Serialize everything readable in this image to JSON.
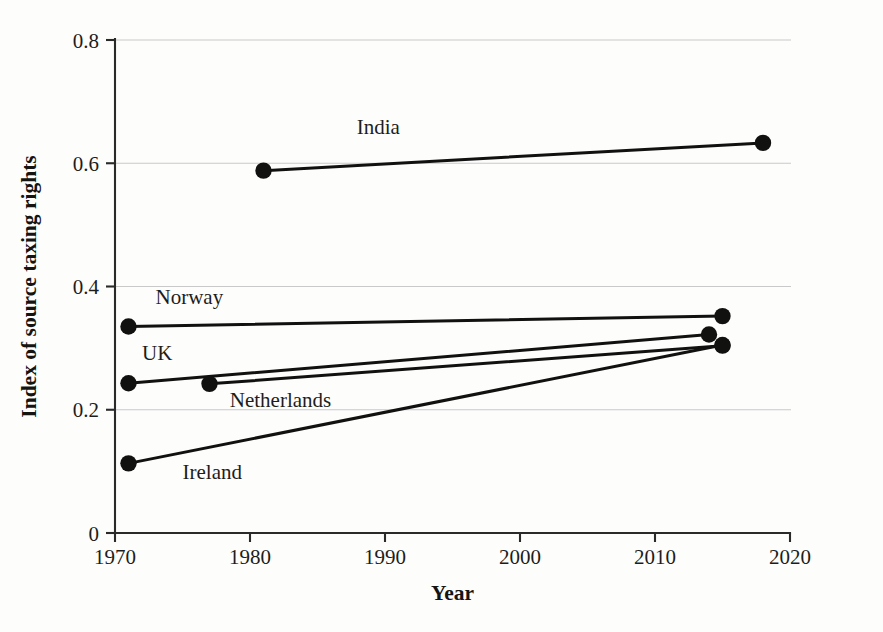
{
  "chart_data": {
    "type": "line",
    "title": "",
    "subtitle": "",
    "xlabel": "Year",
    "ylabel": "Index of source taxing rights",
    "xlim": [
      1970,
      2020
    ],
    "ylim": [
      0,
      0.8
    ],
    "xticks": [
      "1970",
      "1980",
      "1990",
      "2000",
      "2010",
      "2020"
    ],
    "xtick_values": [
      1970,
      1980,
      1990,
      2000,
      2010,
      2020
    ],
    "yticks": [
      "0",
      "0.2",
      "0.4",
      "0.6",
      "0.8"
    ],
    "ytick_values": [
      0,
      0.2,
      0.4,
      0.6,
      0.8
    ],
    "grid": "horizontal",
    "legend_position": "inline-annotations",
    "marker": "filled-circle",
    "line_color": "#111110",
    "grid_color": "#c9c9c9",
    "axis_color": "#2a2a28",
    "background": "#fdfdfc",
    "series": [
      {
        "name": "India",
        "x": [
          1981,
          2018
        ],
        "values": [
          0.588,
          0.633
        ],
        "label": "India",
        "label_x": 1989.5,
        "label_y": 0.648,
        "label_anchor": "middle"
      },
      {
        "name": "Norway",
        "x": [
          1971,
          2015
        ],
        "values": [
          0.335,
          0.352
        ],
        "label": "Norway",
        "label_x": 1973.0,
        "label_y": 0.372,
        "label_anchor": "start"
      },
      {
        "name": "UK",
        "x": [
          1971,
          2014
        ],
        "values": [
          0.243,
          0.322
        ],
        "label": "UK",
        "label_x": 1972.0,
        "label_y": 0.281,
        "label_anchor": "start"
      },
      {
        "name": "Netherlands",
        "x": [
          1977,
          2015
        ],
        "values": [
          0.242,
          0.304
        ],
        "label": "Netherlands",
        "label_x": 1978.5,
        "label_y": 0.205,
        "label_anchor": "start"
      },
      {
        "name": "Ireland",
        "x": [
          1971,
          2015
        ],
        "values": [
          0.113,
          0.305
        ],
        "label": "Ireland",
        "label_x": 1975.0,
        "label_y": 0.088,
        "label_anchor": "start"
      }
    ]
  }
}
